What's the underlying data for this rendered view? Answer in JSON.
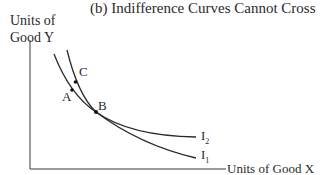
{
  "title": "(b) Indifference Curves Cannot Cross",
  "y_axis_label_line1": "Units of",
  "y_axis_label_line2": "Good Y",
  "x_axis_label": "Units of Good X",
  "points": {
    "a": "A",
    "b": "B",
    "c": "C"
  },
  "curves": {
    "i1": "I",
    "i1_sub": "1",
    "i2": "I",
    "i2_sub": "2"
  },
  "colors": {
    "line": "#2a2a2a",
    "background": "#ffffff"
  }
}
